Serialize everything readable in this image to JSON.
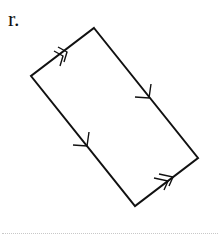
{
  "problem": {
    "label": "r.",
    "shape": "parallelogram",
    "vertices": {
      "top": [
        94,
        28
      ],
      "left": [
        31,
        76
      ],
      "bottom": [
        135,
        206
      ],
      "right": [
        198,
        158
      ]
    },
    "markings": [
      {
        "side": "left-top",
        "type": "double-arrow",
        "at": [
          67,
          51
        ]
      },
      {
        "side": "top-right",
        "type": "single-arrow",
        "at": [
          148,
          97
        ]
      },
      {
        "side": "left-bottom",
        "type": "single-arrow",
        "at": [
          85,
          145
        ]
      },
      {
        "side": "bottom-right",
        "type": "double-arrow",
        "at": [
          168,
          180
        ]
      }
    ],
    "stroke_color": "#111111"
  }
}
